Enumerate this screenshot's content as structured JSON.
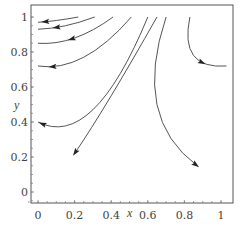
{
  "chart_data": {
    "type": "line",
    "subtype": "phase-portrait / streamlines with direction arrows",
    "title": "",
    "xlabel": "x",
    "ylabel": "y",
    "xlim": [
      -0.05,
      1.05
    ],
    "ylim": [
      -0.05,
      1.07
    ],
    "grid": false,
    "legend": null,
    "x_ticks": [
      "0",
      "0.2",
      "0.4",
      "0.6",
      "0.8",
      "1"
    ],
    "y_ticks": [
      "0",
      "0.2",
      "0.4",
      "0.6",
      "0.8",
      "1"
    ],
    "series": [
      {
        "name": "trajectory-1",
        "points": [
          [
            0.22,
            1.0
          ],
          [
            0.1,
            0.98
          ],
          [
            0.0,
            0.97
          ]
        ],
        "arrow_at": [
          0.04,
          0.97
        ],
        "direction": "left"
      },
      {
        "name": "trajectory-2",
        "points": [
          [
            0.31,
            1.0
          ],
          [
            0.15,
            0.95
          ],
          [
            0.0,
            0.93
          ]
        ],
        "arrow_at": [
          0.1,
          0.94
        ],
        "direction": "left"
      },
      {
        "name": "trajectory-3",
        "points": [
          [
            0.41,
            1.0
          ],
          [
            0.2,
            0.88
          ],
          [
            0.0,
            0.85
          ]
        ],
        "arrow_at": [
          0.18,
          0.88
        ],
        "direction": "left"
      },
      {
        "name": "trajectory-4",
        "points": [
          [
            0.51,
            1.0
          ],
          [
            0.25,
            0.77
          ],
          [
            0.0,
            0.72
          ]
        ],
        "arrow_at": [
          0.08,
          0.72
        ],
        "direction": "left"
      },
      {
        "name": "trajectory-5",
        "points": [
          [
            0.6,
            1.0
          ],
          [
            0.3,
            0.47
          ],
          [
            0.0,
            0.4
          ]
        ],
        "arrow_at": [
          0.03,
          0.4
        ],
        "direction": "left"
      },
      {
        "name": "trajectory-6",
        "points": [
          [
            0.65,
            1.0
          ],
          [
            0.4,
            0.55
          ],
          [
            0.2,
            0.22
          ]
        ],
        "arrow_at": [
          0.2,
          0.22
        ],
        "direction": "down-left"
      },
      {
        "name": "trajectory-7",
        "points": [
          [
            0.7,
            1.0
          ],
          [
            0.65,
            0.5
          ],
          [
            0.87,
            0.15
          ]
        ],
        "arrow_at": [
          0.87,
          0.15
        ],
        "direction": "down-right"
      },
      {
        "name": "trajectory-8",
        "points": [
          [
            0.83,
            1.0
          ],
          [
            0.85,
            0.78
          ],
          [
            1.03,
            0.72
          ]
        ],
        "arrow_at": [
          0.9,
          0.75
        ],
        "direction": "down-right"
      }
    ]
  },
  "axes": {
    "x_label": "x",
    "y_label": "y",
    "x_tick_labels": [
      "0",
      "0.2",
      "0.4",
      "0.6",
      "0.8",
      "1"
    ],
    "y_tick_labels": [
      "0",
      "0.2",
      "0.4",
      "0.6",
      "0.8",
      "1"
    ]
  }
}
